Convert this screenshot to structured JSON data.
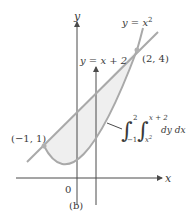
{
  "figure": {
    "caption": "(b)",
    "colors": {
      "curve": "#a9a9a9",
      "region_fill": "#efefef",
      "axis": "#4a4a4a",
      "text": "#3a3a3a",
      "point": "#b0b0b0"
    },
    "axes": {
      "x_label": "x",
      "y_label": "y",
      "origin_label": "0"
    },
    "curves": {
      "parabola": {
        "label_prefix": "y = x",
        "label_exp": "2",
        "equation": "y = x^2"
      },
      "line": {
        "label": "y = x + 2",
        "equation": "y = x + 2"
      }
    },
    "points": [
      {
        "label": "(−1, 1)",
        "x": -1,
        "y": 1
      },
      {
        "label": "(2, 4)",
        "x": 2,
        "y": 4
      }
    ],
    "integral": {
      "outer_lower": "−1",
      "outer_upper": "2",
      "inner_lower": "x",
      "inner_lower_exp": "2",
      "inner_upper": "x + 2",
      "integrand": "dy dx",
      "expression": "∫_{-1}^{2} ∫_{x^2}^{x+2} dy dx"
    },
    "vertical_strip_arrow": {
      "x": 0.5,
      "direction": "up"
    }
  }
}
